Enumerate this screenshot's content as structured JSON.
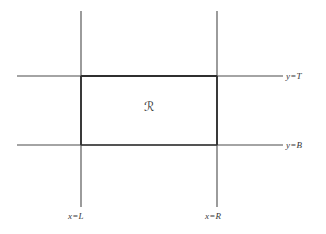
{
  "figure": {
    "background_color": "#ffffff",
    "line_color": "#4a4a4a",
    "bold_line_color": "#2f2f2f",
    "text_color": "#383838"
  },
  "labels": {
    "y_top": "y=T",
    "y_bottom": "y=B",
    "x_left": "x=L",
    "x_right": "x=R",
    "region": "ℛ"
  },
  "chart_data": {
    "type": "diagram",
    "title": "",
    "xlabel": "",
    "ylabel": "",
    "lines": [
      {
        "name": "vertical-line-x-equals-L",
        "orientation": "vertical",
        "label": "x=L",
        "x": 81,
        "y_start": 11,
        "y_end": 207
      },
      {
        "name": "vertical-line-x-equals-R",
        "orientation": "vertical",
        "label": "x=R",
        "x": 217,
        "y_start": 11,
        "y_end": 207
      },
      {
        "name": "horizontal-line-y-equals-T",
        "orientation": "horizontal",
        "label": "y=T",
        "y": 76,
        "x_start": 17,
        "x_end": 283
      },
      {
        "name": "horizontal-line-y-equals-B",
        "orientation": "horizontal",
        "label": "y=B",
        "y": 145,
        "x_start": 17,
        "x_end": 283
      }
    ],
    "rectangle": {
      "name": "region-R",
      "label": "ℛ",
      "left": 81,
      "right": 217,
      "top": 76,
      "bottom": 145,
      "width": 136,
      "height": 69,
      "emphasized_edges": true
    },
    "label_positions": {
      "y_top": {
        "x": 286,
        "y": 72
      },
      "y_bottom": {
        "x": 286,
        "y": 141
      },
      "x_left": {
        "x": 68,
        "y": 212
      },
      "x_right": {
        "x": 205,
        "y": 212
      },
      "region": {
        "x": 144,
        "y": 101
      }
    }
  }
}
